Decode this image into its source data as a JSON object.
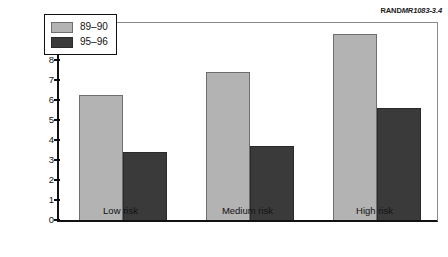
{
  "credit": {
    "mark": "RAND",
    "doc_id": "MR1083-3.4"
  },
  "chart_data": {
    "type": "bar",
    "title": "",
    "subtitle": "",
    "xlabel": "",
    "ylabel": "Percentage of teachers",
    "categories": [
      "Low risk",
      "Medium risk",
      "High risk"
    ],
    "series": [
      {
        "name": "89–90",
        "color": "#b3b3b3",
        "values": [
          6.25,
          7.4,
          9.3
        ]
      },
      {
        "name": "95–96",
        "color": "#3a3a3a",
        "values": [
          3.4,
          3.7,
          5.6
        ]
      }
    ],
    "ylim": [
      0,
      10
    ],
    "yticks": [
      0,
      1,
      2,
      3,
      4,
      5,
      6,
      7,
      8,
      9,
      10
    ],
    "ytick_labels": [
      "0",
      "1",
      "2",
      "3",
      "4",
      "5",
      "6",
      "7",
      "8",
      "9",
      "10"
    ],
    "grid": false,
    "legend_position": "upper-left-inside"
  }
}
